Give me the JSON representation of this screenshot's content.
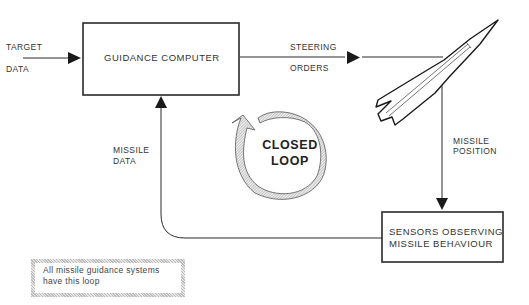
{
  "diagram": {
    "type": "closed-loop block diagram",
    "nodes": {
      "guidance_computer": {
        "label": "GUIDANCE COMPUTER"
      },
      "missile": {
        "label": ""
      },
      "sensors": {
        "line1": "SENSORS OBSERVING",
        "line2": "MISSILE BEHAVIOUR"
      }
    },
    "edges": {
      "target_data": {
        "line1": "TARGET",
        "line2": "DATA"
      },
      "steering_orders": {
        "line1": "STEERING",
        "line2": "ORDERS"
      },
      "missile_position": {
        "line1": "MISSILE",
        "line2": "POSITION"
      },
      "missile_data": {
        "line1": "MISSILE",
        "line2": "DATA"
      }
    },
    "loop_label": {
      "line1": "CLOSED",
      "line2": "LOOP"
    },
    "note": {
      "line1": "All missile guidance systems",
      "line2": "have this loop"
    },
    "colors": {
      "line": "#2a2a2a",
      "hatch": "#bdbdbd",
      "background": "#ffffff"
    }
  }
}
